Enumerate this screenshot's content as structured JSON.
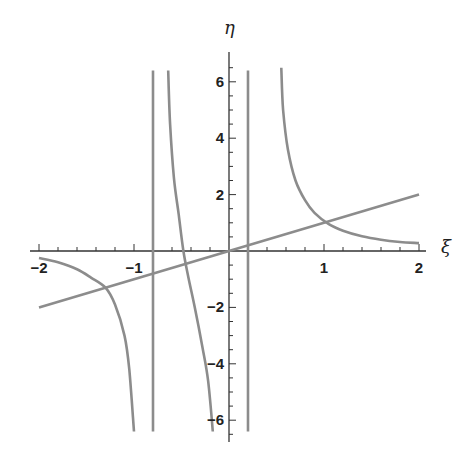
{
  "chart_data": {
    "type": "line",
    "title": "",
    "xlabel": "ξ",
    "ylabel": "η",
    "xlim": [
      -2,
      2
    ],
    "ylim": [
      -6.5,
      6.5
    ],
    "grid": false,
    "legend": null,
    "x_ticks": [
      -2,
      -1,
      1,
      2
    ],
    "x_tick_labels": [
      "-2",
      "-1",
      "1",
      "2"
    ],
    "y_ticks": [
      -6,
      -4,
      -2,
      2,
      4,
      6
    ],
    "y_tick_labels": [
      "-6",
      "-4",
      "-2",
      "2",
      "4",
      "6"
    ],
    "x_minor_step": 0.2,
    "y_minor_step": 0.5,
    "line_color": "#8c8c8c",
    "axis_color": "#333333",
    "series": [
      {
        "name": "diagonal line η = ξ",
        "points": [
          [
            -2,
            -2
          ],
          [
            2,
            2
          ]
        ]
      },
      {
        "name": "curve left branch",
        "points": [
          [
            -2.0,
            -0.25
          ],
          [
            -1.8,
            -0.4
          ],
          [
            -1.6,
            -0.65
          ],
          [
            -1.45,
            -0.95
          ],
          [
            -1.3,
            -1.3
          ],
          [
            -1.2,
            -1.9
          ],
          [
            -1.1,
            -3.0
          ],
          [
            -1.05,
            -4.2
          ],
          [
            -1.0,
            -6.4
          ]
        ]
      },
      {
        "name": "curve middle branch",
        "points": [
          [
            -0.64,
            6.4
          ],
          [
            -0.62,
            4.5
          ],
          [
            -0.58,
            2.6
          ],
          [
            -0.53,
            1.3
          ],
          [
            -0.48,
            0.0
          ],
          [
            -0.43,
            -0.9
          ],
          [
            -0.36,
            -2.0
          ],
          [
            -0.28,
            -3.4
          ],
          [
            -0.22,
            -4.6
          ],
          [
            -0.17,
            -6.4
          ]
        ]
      },
      {
        "name": "curve right branch",
        "points": [
          [
            0.55,
            6.5
          ],
          [
            0.57,
            5.0
          ],
          [
            0.62,
            3.6
          ],
          [
            0.7,
            2.5
          ],
          [
            0.8,
            1.8
          ],
          [
            0.9,
            1.35
          ],
          [
            1.05,
            0.95
          ],
          [
            1.2,
            0.72
          ],
          [
            1.4,
            0.52
          ],
          [
            1.6,
            0.4
          ],
          [
            1.8,
            0.32
          ],
          [
            2.0,
            0.28
          ]
        ]
      },
      {
        "name": "vertical asymptote 1",
        "points": [
          [
            -0.8,
            -6.4
          ],
          [
            -0.8,
            6.4
          ]
        ]
      },
      {
        "name": "vertical asymptote 2",
        "points": [
          [
            0.2,
            -6.4
          ],
          [
            0.2,
            6.4
          ]
        ]
      }
    ]
  }
}
